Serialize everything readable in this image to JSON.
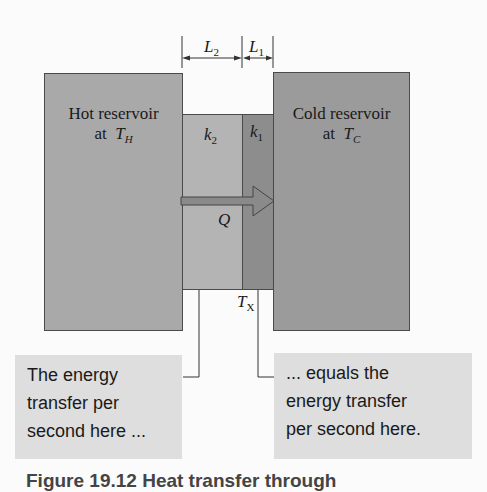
{
  "figure": {
    "hot_reservoir": {
      "line1": "Hot reservoir",
      "line2_prefix": "at ",
      "symbol": "T",
      "subscript": "H"
    },
    "cold_reservoir": {
      "line1": "Cold reservoir",
      "line2_prefix": "at ",
      "symbol": "T",
      "subscript": "C"
    },
    "slabs": [
      {
        "symbol": "k",
        "subscript": "2",
        "length_symbol": "L",
        "length_subscript": "2"
      },
      {
        "symbol": "k",
        "subscript": "1",
        "length_symbol": "L",
        "length_subscript": "1"
      }
    ],
    "heat_flow": {
      "label": "Q",
      "direction": "right"
    },
    "interface_temperature": {
      "symbol": "T",
      "subscript": "X"
    },
    "notes": {
      "left": [
        "The energy",
        "transfer per",
        "second here ..."
      ],
      "right": [
        "... equals the",
        "energy transfer",
        "per second here."
      ]
    },
    "caption_partial": "Figure 19.12 Heat transfer through"
  },
  "colors": {
    "background": "#fbfbfb",
    "hot_reservoir": "#a9a9a9",
    "cold_reservoir": "#9b9b9b",
    "slab_k2": "#b4b4b4",
    "slab_k1": "#8d8d8d",
    "note_box": "#dedede",
    "arrow": "#8a8a8a",
    "outline": "#4a4a4a"
  }
}
